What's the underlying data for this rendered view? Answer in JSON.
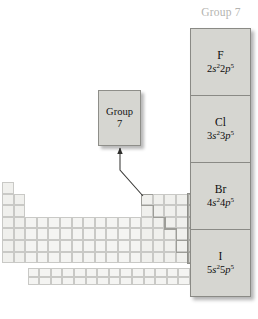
{
  "figure": {
    "panel_title": "Group 7",
    "callout": {
      "line1": "Group",
      "line2": "7"
    },
    "elements": [
      {
        "symbol": "F",
        "configuration": "2s²2p⁵",
        "s_shell": "2",
        "s_orbital": "s",
        "s_count": "2",
        "p_shell": "2",
        "p_orbital": "p",
        "p_count": "5"
      },
      {
        "symbol": "Cl",
        "configuration": "3s²3p⁵",
        "s_shell": "3",
        "s_orbital": "s",
        "s_count": "2",
        "p_shell": "3",
        "p_orbital": "p",
        "p_count": "5"
      },
      {
        "symbol": "Br",
        "configuration": "4s²4p⁵",
        "s_shell": "4",
        "s_orbital": "s",
        "s_count": "2",
        "p_shell": "4",
        "p_orbital": "p",
        "p_count": "5"
      },
      {
        "symbol": "I",
        "configuration": "5s²5p⁵",
        "s_shell": "5",
        "s_orbital": "s",
        "s_count": "2",
        "p_shell": "5",
        "p_orbital": "p",
        "p_count": "5"
      }
    ]
  },
  "colors": {
    "panel_fill": "#d6d6d1",
    "panel_border": "#8a8a85",
    "title_text": "#b4b4b0",
    "highlight_fill": "#d2d2cd",
    "highlight_border": "#8f8f8a",
    "grid_fill": "#f1f1ee",
    "grid_border": "#c9c9c6",
    "arrow_stroke": "#3a3a38",
    "text": "#0d0d0d"
  },
  "periodic_table": {
    "description": "Faded periodic table outline with the halogen column highlighted",
    "highlighted_group": "7",
    "cell_width": 11.6,
    "cell_height": 11.6,
    "origin_x": 2,
    "origin_y": 182,
    "rows": 7,
    "columns": 18,
    "fblock_rows": 2,
    "fblock_columns": 14
  }
}
